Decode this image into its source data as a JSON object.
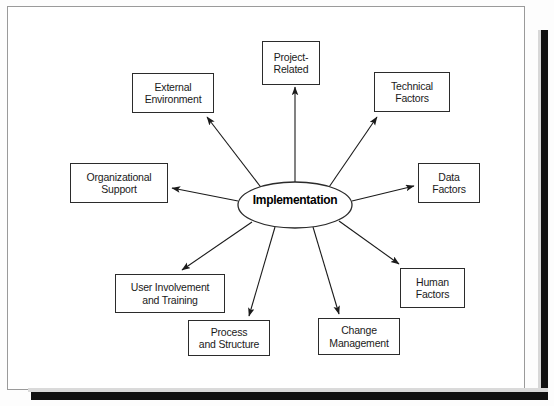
{
  "diagram": {
    "type": "hub-and-spoke",
    "title_text": "",
    "hub": {
      "label": "Implementation",
      "shape": "ellipse",
      "cx": 295,
      "cy": 205,
      "rx": 57,
      "ry": 23
    },
    "colors": {
      "page_background": "#ffffff",
      "sheet": "#fdfdfd",
      "frame_border": "#9a9a9a",
      "node_border": "#2b2b2b",
      "node_fill": "#ffffff",
      "text": "#1a1a1a",
      "arrow": "#1a1a1a",
      "scan_shadow": "#111111"
    },
    "nodes": [
      {
        "id": "project-related",
        "label": "Project-\nRelated",
        "x": 262,
        "y": 41,
        "w": 58,
        "h": 44,
        "arrow_from": [
          295,
          182
        ],
        "arrow_to": [
          295,
          87
        ]
      },
      {
        "id": "external-environment",
        "label": "External\nEnvironment",
        "x": 132,
        "y": 73,
        "w": 82,
        "h": 40,
        "arrow_from": [
          263,
          190
        ],
        "arrow_to": [
          207,
          117
        ]
      },
      {
        "id": "technical-factors",
        "label": "Technical\nFactors",
        "x": 374,
        "y": 72,
        "w": 76,
        "h": 40,
        "arrow_from": [
          327,
          190
        ],
        "arrow_to": [
          377,
          117
        ]
      },
      {
        "id": "organizational-support",
        "label": "Organizational\nSupport",
        "x": 70,
        "y": 163,
        "w": 98,
        "h": 40,
        "arrow_from": [
          238,
          201
        ],
        "arrow_to": [
          172,
          188
        ]
      },
      {
        "id": "data-factors",
        "label": "Data\nFactors",
        "x": 418,
        "y": 163,
        "w": 62,
        "h": 40,
        "arrow_from": [
          352,
          201
        ],
        "arrow_to": [
          414,
          186
        ]
      },
      {
        "id": "user-involvement-and-training",
        "label": "User Involvement\nand Training",
        "x": 115,
        "y": 274,
        "w": 110,
        "h": 39,
        "arrow_from": [
          252,
          222
        ],
        "arrow_to": [
          182,
          270
        ]
      },
      {
        "id": "human-factors",
        "label": "Human\nFactors",
        "x": 400,
        "y": 268,
        "w": 65,
        "h": 40,
        "arrow_from": [
          339,
          221
        ],
        "arrow_to": [
          399,
          264
        ]
      },
      {
        "id": "process-and-structure",
        "label": "Process\nand Structure",
        "x": 188,
        "y": 320,
        "w": 82,
        "h": 36,
        "arrow_from": [
          275,
          227
        ],
        "arrow_to": [
          249,
          316
        ]
      },
      {
        "id": "change-management",
        "label": "Change\nManagement",
        "x": 318,
        "y": 318,
        "w": 82,
        "h": 37,
        "arrow_from": [
          313,
          227
        ],
        "arrow_to": [
          339,
          314
        ]
      }
    ]
  }
}
